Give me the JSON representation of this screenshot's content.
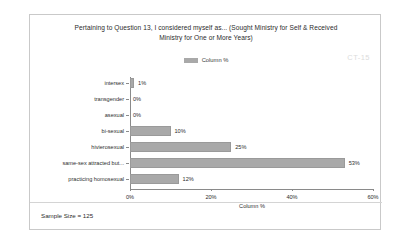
{
  "card": {
    "watermark": "CT-15",
    "sample_size_text": "Sample Size = 125"
  },
  "title": {
    "line1": "Pertaining to Question 13, I considered myself as... (Sought Ministry for Self & Received",
    "line2": "Ministry for One or More Years)"
  },
  "legend": {
    "label": "Column %"
  },
  "colors": {
    "bar_fill": "#a9a9a9",
    "axis": "#8a8a8a",
    "frame": "#c9c9c9",
    "watermark": "#dcdcdc"
  },
  "chart_data": {
    "type": "bar",
    "orientation": "horizontal",
    "title": "Pertaining to Question 13, I considered myself as... (Sought Ministry for Self & Received Ministry for One or More Years)",
    "categories": [
      "intersex",
      "transgender",
      "asexual",
      "bi-sexual",
      "hivierosexual",
      "same-sex attracted but...",
      "practicing homosexual"
    ],
    "values": [
      1,
      0,
      0,
      10,
      25,
      53,
      12
    ],
    "data_labels": [
      "1%",
      "0%",
      "0%",
      "10%",
      "25%",
      "53%",
      "12%"
    ],
    "series": [
      {
        "name": "Column %",
        "values": [
          1,
          0,
          0,
          10,
          25,
          53,
          12
        ]
      }
    ],
    "xlabel": "Column %",
    "ylabel": "",
    "xlim": [
      0,
      60
    ],
    "xticks": [
      0,
      20,
      40,
      60
    ],
    "xtick_labels": [
      "0%",
      "20%",
      "40%",
      "60%"
    ],
    "grid": false,
    "legend_position": "top-center",
    "annotations": [
      "CT-15",
      "Sample Size = 125"
    ]
  }
}
